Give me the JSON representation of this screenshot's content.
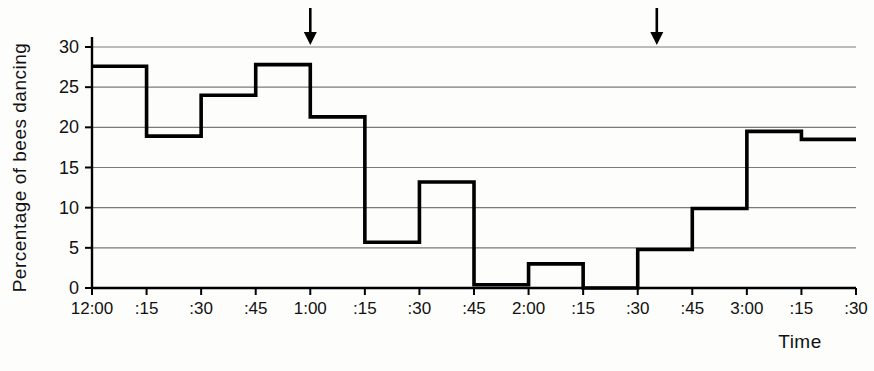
{
  "chart_data": {
    "type": "line",
    "subtype": "step-post",
    "title": "",
    "xlabel": "Time",
    "ylabel": "Percentage of bees dancing",
    "ylim": [
      0,
      30
    ],
    "yticks": [
      0,
      5,
      10,
      15,
      20,
      25,
      30
    ],
    "ytick_labels": [
      "0",
      "5",
      "10",
      "15",
      "20",
      "25",
      "30"
    ],
    "grid": "horizontal",
    "legend": "none",
    "x": [
      "12:00",
      ":15",
      ":30",
      ":45",
      "1:00",
      ":15",
      ":30",
      ":45",
      "2:00",
      ":15",
      ":30",
      ":45",
      "3:00",
      ":15",
      ":30"
    ],
    "xtick_labels": [
      "12:00",
      ":15",
      ":30",
      ":45",
      "1:00",
      ":15",
      ":30",
      ":45",
      "2:00",
      ":15",
      ":30",
      ":45",
      "3:00",
      ":15",
      ":30"
    ],
    "categories": [
      "12:00",
      ":15",
      ":30",
      ":45",
      "1:00",
      ":15",
      ":30",
      ":45",
      "2:00",
      ":15",
      ":30",
      ":45",
      "3:00",
      ":15",
      ":30"
    ],
    "series": [
      {
        "name": "Percentage of bees dancing",
        "values": [
          27.6,
          18.9,
          24.0,
          27.8,
          21.3,
          5.7,
          13.2,
          0.4,
          3.0,
          0.0,
          4.8,
          9.9,
          19.5,
          18.5,
          18.5
        ]
      }
    ],
    "intervals": [
      {
        "start": "12:00",
        "end": ":15",
        "value": 27.6
      },
      {
        "start": ":15",
        "end": ":30",
        "value": 18.9
      },
      {
        "start": ":30",
        "end": ":45",
        "value": 24.0
      },
      {
        "start": ":45",
        "end": "1:00",
        "value": 27.8
      },
      {
        "start": "1:00",
        "end": ":15",
        "value": 21.3
      },
      {
        "start": ":15",
        "end": ":30",
        "value": 5.7
      },
      {
        "start": ":30",
        "end": ":45",
        "value": 13.2
      },
      {
        "start": ":45",
        "end": "2:00",
        "value": 0.4
      },
      {
        "start": "2:00",
        "end": ":15",
        "value": 3.0
      },
      {
        "start": ":15",
        "end": ":30",
        "value": 0.0
      },
      {
        "start": ":30",
        "end": ":45",
        "value": 4.8
      },
      {
        "start": ":45",
        "end": "3:00",
        "value": 9.9
      },
      {
        "start": "3:00",
        "end": ":15",
        "value": 19.5
      },
      {
        "start": ":15",
        "end": ":30",
        "value": 18.5
      }
    ],
    "annotations": [
      {
        "type": "arrow-down",
        "x": "1:00",
        "label": ""
      },
      {
        "type": "arrow-down",
        "x": "2:35",
        "label": ""
      }
    ],
    "colors": {
      "line": "#000000",
      "grid": "#7a7a7a",
      "axis": "#000000",
      "background": "#fdfdfc"
    }
  }
}
